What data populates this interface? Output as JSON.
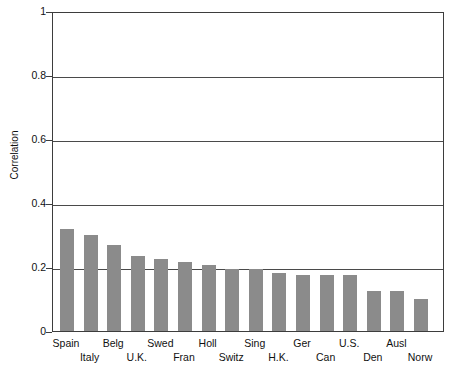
{
  "chart_data": {
    "type": "bar",
    "title": "",
    "xlabel": "",
    "ylabel": "Correlation",
    "ylim": [
      0,
      1
    ],
    "yticks": [
      "0",
      "0.2",
      "0.4",
      "0.6",
      "0.8",
      "1"
    ],
    "ytick_values": [
      0,
      0.2,
      0.4,
      0.6,
      0.8,
      1
    ],
    "grid": "horizontal",
    "legend": "none",
    "bar_color": "#8b8b8b",
    "categories": [
      "Spain",
      "Italy",
      "Belg",
      "U.K.",
      "Swed",
      "Fran",
      "Holl",
      "Switz",
      "Sing",
      "H.K.",
      "Ger",
      "Can",
      "U.S.",
      "Den",
      "Ausl",
      "Norw"
    ],
    "values": [
      0.32,
      0.3,
      0.27,
      0.235,
      0.225,
      0.215,
      0.205,
      0.195,
      0.195,
      0.18,
      0.175,
      0.175,
      0.175,
      0.125,
      0.125,
      0.1
    ]
  },
  "axes": {
    "y_title": "Correlation"
  }
}
